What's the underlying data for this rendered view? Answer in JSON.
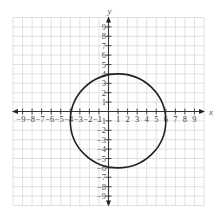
{
  "figure": {
    "title": "",
    "x_axis": {
      "label": "x",
      "min": -9,
      "max": 9,
      "ticks": [
        -9,
        -8,
        -7,
        -6,
        -5,
        -4,
        -3,
        -2,
        -1,
        1,
        2,
        3,
        4,
        5,
        6,
        7,
        8,
        9
      ]
    },
    "y_axis": {
      "label": "y",
      "min": -9,
      "max": 9,
      "ticks": [
        9,
        8,
        7,
        6,
        5,
        4,
        3,
        2,
        1,
        -1,
        -2,
        -3,
        -4,
        -5,
        -6,
        -7,
        -8,
        -9
      ]
    },
    "grid": {
      "min": -10,
      "max": 10,
      "step": 1,
      "color": "#d4d4d4"
    },
    "circle": {
      "center_x": 1,
      "center_y": -1,
      "radius": 5,
      "stroke": "#222222"
    }
  },
  "chart_data": {
    "type": "scatter",
    "title": "",
    "xlabel": "x",
    "ylabel": "y",
    "xlim": [
      -10,
      10
    ],
    "ylim": [
      -10,
      10
    ],
    "grid": true,
    "x_tick_labels": [
      "-9",
      "-8",
      "-7",
      "-6",
      "-5",
      "-4",
      "-3",
      "-2",
      "-1",
      "1",
      "2",
      "3",
      "4",
      "5",
      "6",
      "7",
      "8",
      "9"
    ],
    "y_tick_labels": [
      "9",
      "8",
      "7",
      "6",
      "5",
      "4",
      "3",
      "2",
      "1",
      "-1",
      "-2",
      "-3",
      "-4",
      "-5",
      "-6",
      "-7",
      "-8",
      "-9"
    ],
    "shapes": [
      {
        "kind": "circle",
        "center": [
          1,
          -1
        ],
        "radius": 5,
        "equation": "(x-1)^2 + (y+1)^2 = 25",
        "key_points": {
          "left": [
            -4,
            -1
          ],
          "right": [
            6,
            -1
          ],
          "top": [
            1,
            4
          ],
          "bottom": [
            1,
            -6
          ]
        }
      }
    ]
  }
}
